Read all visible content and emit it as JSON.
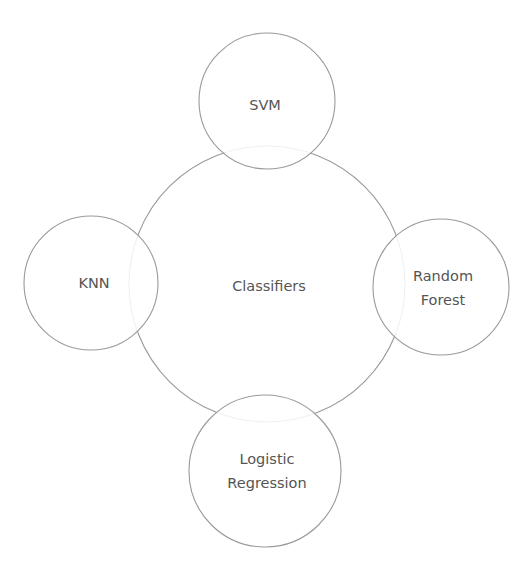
{
  "diagram": {
    "type": "hub-and-spoke",
    "hub": {
      "label": "Classifiers"
    },
    "satellites": [
      {
        "id": "svm",
        "position": "top",
        "lines": [
          "SVM"
        ]
      },
      {
        "id": "knn",
        "position": "left",
        "lines": [
          "KNN"
        ]
      },
      {
        "id": "random-forest",
        "position": "right",
        "lines": [
          "Random",
          "Forest"
        ]
      },
      {
        "id": "logistic-regression",
        "position": "bottom",
        "lines": [
          "Logistic",
          "Regression"
        ]
      }
    ],
    "colors": {
      "stroke": "#9a9a9a",
      "text": "#555555",
      "background": "#ffffff"
    }
  }
}
